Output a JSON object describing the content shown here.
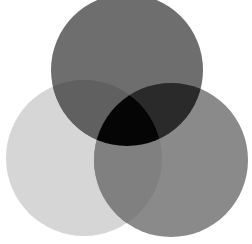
{
  "canvas": {
    "width": 252,
    "height": 244,
    "background": "#ffffff"
  },
  "diagram": {
    "type": "venn-3",
    "circles": [
      {
        "id": "top",
        "cx": 127,
        "cy": 70,
        "r": 76
      },
      {
        "id": "left",
        "cx": 84,
        "cy": 158,
        "r": 78
      },
      {
        "id": "right",
        "cx": 171,
        "cy": 160,
        "r": 77
      }
    ],
    "region_colors": {
      "left_only": "#d6d6d6",
      "top_only": "#6e6e6e",
      "right_only": "#8a8a8a",
      "top_left": "#606060",
      "top_right": "#2a2a2a",
      "left_right": "#808080",
      "all_three": "#050505"
    }
  }
}
